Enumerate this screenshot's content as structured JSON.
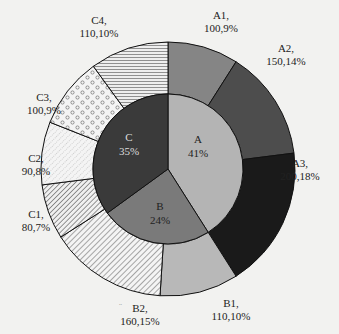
{
  "chart_data": {
    "type": "pie",
    "subtype": "nested-donut",
    "start_angle": "12 o'clock",
    "direction": "clockwise",
    "inner_ring": {
      "categories": [
        "A",
        "B",
        "C"
      ],
      "values_pct": [
        41,
        24,
        35
      ],
      "labels": [
        "A\n41%",
        "B\n24%",
        "C\n35%"
      ]
    },
    "outer_ring": {
      "categories": [
        "A1",
        "A2",
        "A3",
        "B1",
        "B2",
        "C1",
        "C2",
        "C3",
        "C4"
      ],
      "values": [
        100,
        150,
        200,
        110,
        160,
        80,
        90,
        100,
        110
      ],
      "values_pct": [
        9,
        14,
        18,
        10,
        15,
        7,
        8,
        9,
        10
      ],
      "parent": [
        "A",
        "A",
        "A",
        "B",
        "B",
        "C",
        "C",
        "C",
        "C"
      ],
      "labels": [
        "A1,\n100,9%",
        "A2,\n150,14%",
        "A3,\n200,18%",
        "B1,\n110,10%",
        "B2,\n160,15%",
        "C1,\n80,7%",
        "C2,\n90,8%",
        "C3,\n100,9%",
        "C4,\n110,10%"
      ]
    },
    "title": "",
    "legend": "none"
  },
  "inner": [
    {
      "name": "A",
      "pct": "41%",
      "fill": "#b4b4b4",
      "text": "#222222"
    },
    {
      "name": "B",
      "pct": "24%",
      "fill": "#7a7a7a",
      "text": "#222222"
    },
    {
      "name": "C",
      "pct": "35%",
      "fill": "#3a3a3a",
      "text": "#dddddd"
    }
  ],
  "outer": [
    {
      "name": "A1,",
      "val": "100,9%",
      "pct": 9,
      "fill": "#858585"
    },
    {
      "name": "A2,",
      "val": "150,14%",
      "pct": 14,
      "fill": "#4d4d4d"
    },
    {
      "name": "A3,",
      "val": "200,18%",
      "pct": 18,
      "fill": "#1a1a1a"
    },
    {
      "name": "B1,",
      "val": "110,10%",
      "pct": 10,
      "fill": "#b8b8b8"
    },
    {
      "name": "B2,",
      "val": "160,15%",
      "pct": 15,
      "fill": "url(#hatchDiag)"
    },
    {
      "name": "C1,",
      "val": "80,7%",
      "pct": 7,
      "fill": "url(#hatchDiag2)"
    },
    {
      "name": "C2,",
      "val": "90,8%",
      "pct": 8,
      "fill": "url(#hatchDash)"
    },
    {
      "name": "C3,",
      "val": "100,9%",
      "pct": 9,
      "fill": "url(#circles)"
    },
    {
      "name": "C4,",
      "val": "110,10%",
      "pct": 10,
      "fill": "url(#hstripes)"
    }
  ],
  "stray_mark": "..",
  "colors": {
    "background": "#f2f2f0",
    "stroke": "#111111"
  }
}
